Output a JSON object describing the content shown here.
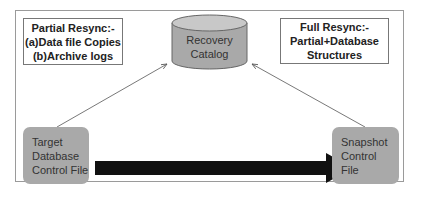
{
  "partial_resync": {
    "title": "Partial Resync:-",
    "lines": [
      "(a)Data file Copies",
      "(b)Archive logs"
    ]
  },
  "full_resync": {
    "title": "Full Resync:-",
    "lines": [
      "Partial+Database",
      "Structures"
    ]
  },
  "recovery_catalog": {
    "lines": [
      "Recovery",
      "Catalog"
    ]
  },
  "target_control_file": {
    "lines": [
      "Target",
      "Database",
      "Control File"
    ]
  },
  "snapshot_control_file": {
    "lines": [
      "Snapshot",
      "Control",
      "File"
    ]
  },
  "colors": {
    "box_fill": "#a9a9a9",
    "arrow": "#111111",
    "frame": "#9a9a9a"
  }
}
